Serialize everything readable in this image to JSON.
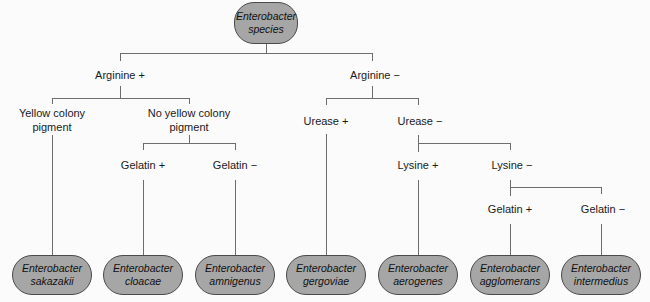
{
  "root": {
    "line1": "Enterobacter",
    "line2": "species"
  },
  "level1": {
    "left": "Arginine +",
    "right": "Arginine −"
  },
  "arg_pos": {
    "yellow": "Yellow colony pigment",
    "no_yellow": "No yellow colony pigment",
    "gelatin_pos": "Gelatin +",
    "gelatin_neg": "Gelatin −"
  },
  "arg_neg": {
    "urease_pos": "Urease +",
    "urease_neg": "Urease −",
    "lysine_pos": "Lysine +",
    "lysine_neg": "Lysine −",
    "gelatin_pos": "Gelatin +",
    "gelatin_neg": "Gelatin −"
  },
  "leaves": [
    {
      "genus": "Enterobacter",
      "species": "sakazakii"
    },
    {
      "genus": "Enterobacter",
      "species": "cloacae"
    },
    {
      "genus": "Enterobacter",
      "species": "amnigenus"
    },
    {
      "genus": "Enterobacter",
      "species": "gergoviae"
    },
    {
      "genus": "Enterobacter",
      "species": "aerogenes"
    },
    {
      "genus": "Enterobacter",
      "species": "agglomerans"
    },
    {
      "genus": "Enterobacter",
      "species": "intermedius"
    }
  ]
}
